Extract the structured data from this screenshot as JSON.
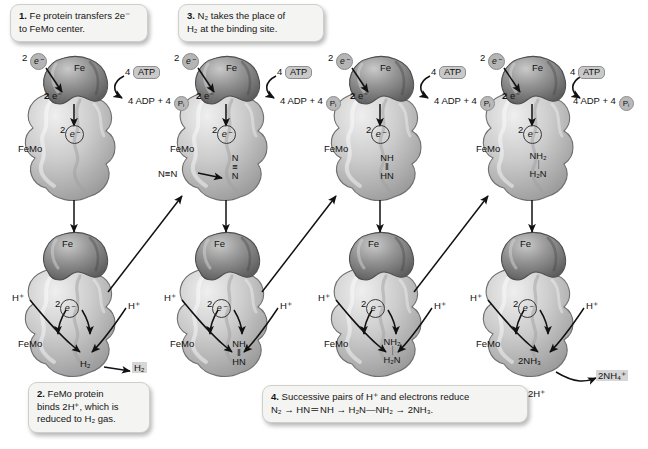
{
  "figure": {
    "background": "#ffffff",
    "fe_lobe_color": "#8a8a8a",
    "femo_lobe_color": "#c6c6c6",
    "callout_bg": "#f4f4f2"
  },
  "callouts": [
    {
      "id": "callout-1",
      "num": "1.",
      "line1": " Fe protein transfers 2e⁻",
      "line2": "to FeMo center."
    },
    {
      "id": "callout-3",
      "num": "3.",
      "line1": " N₂ takes the place of",
      "line2": "H₂ at the binding site."
    },
    {
      "id": "callout-2",
      "num": "2.",
      "line1": " FeMo protein",
      "line2": "binds 2H⁺, which is",
      "line3": "reduced to H₂ gas."
    },
    {
      "id": "callout-4",
      "num": "4.",
      "line1": " Successive pairs of H⁺ and electrons reduce",
      "line2": "N₂ → HN＝NH → H₂N—NH₂ → 2NH₃."
    }
  ],
  "labels": {
    "fe": "Fe",
    "femo": "FeMo",
    "two_electrons": "2",
    "electron_glyph": "e⁻",
    "atp_count": "4",
    "atp": "ATP",
    "adp_line": "4 ADP + 4",
    "pi": "P",
    "pi_sub": "i",
    "h_plus": "H⁺",
    "n2_free": "N≡N",
    "h2_bound": "H₂",
    "h2_released": "H₂",
    "nh3_bound": "2NH₃",
    "nh4_released": "2NH₄⁺",
    "two_h_plus": "2H⁺"
  },
  "top_row": [
    {
      "id": "top-1",
      "substrate_top": "",
      "substrate_bond": "",
      "substrate_bottom": "",
      "incoming": ""
    },
    {
      "id": "top-2",
      "substrate_top": "N",
      "substrate_bond": "≡",
      "substrate_bottom": "N",
      "incoming": "N≡N"
    },
    {
      "id": "top-3",
      "substrate_top": "NH",
      "substrate_bond": "‖",
      "substrate_bottom": "HN",
      "incoming": ""
    },
    {
      "id": "top-4",
      "substrate_top": "NH₂",
      "substrate_bond": "｜",
      "substrate_bottom": "H₂N",
      "incoming": ""
    }
  ],
  "bottom_row": [
    {
      "id": "bottom-1",
      "product_bound": "H₂",
      "product_top": "",
      "product_bond": "",
      "product_bottom": "",
      "released": "H₂",
      "released_extra": ""
    },
    {
      "id": "bottom-2",
      "product_bound": "",
      "product_top": "NH",
      "product_bond": "‖",
      "product_bottom": "HN",
      "released": "",
      "released_extra": ""
    },
    {
      "id": "bottom-3",
      "product_bound": "",
      "product_top": "NH₂",
      "product_bond": "｜",
      "product_bottom": "H₂N",
      "released": "",
      "released_extra": ""
    },
    {
      "id": "bottom-4",
      "product_bound": "2NH₃",
      "product_top": "",
      "product_bond": "",
      "product_bottom": "",
      "released": "2NH₄⁺",
      "released_extra": "2H⁺"
    }
  ]
}
